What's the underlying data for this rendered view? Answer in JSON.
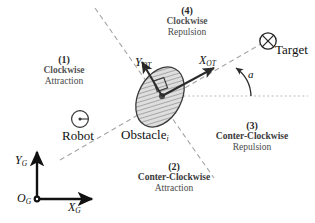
{
  "figure": {
    "type": "schematic-diagram"
  },
  "regions": [
    {
      "number": "(1)",
      "line1": "Clockwise",
      "line2": "Attraction"
    },
    {
      "number": "(2)",
      "line1": "Conter-Clockwise",
      "line2": "Attraction"
    },
    {
      "number": "(3)",
      "line1": "Conter-Clockwise",
      "line2": "Repulsion"
    },
    {
      "number": "(4)",
      "line1": "Clockwise",
      "line2": "Repulsion"
    }
  ],
  "axes": {
    "local_y": {
      "symbol": "Y",
      "subscript": "OT"
    },
    "local_x": {
      "symbol": "X",
      "subscript": "OT"
    },
    "global_y": {
      "symbol": "Y",
      "subscript": "G"
    },
    "global_x": {
      "symbol": "X",
      "subscript": "G"
    },
    "global_origin": {
      "symbol": "O",
      "subscript": "G"
    }
  },
  "entities": {
    "robot": {
      "label": "Robot",
      "icon": "robot-circle-heading-icon"
    },
    "target": {
      "label": "Target",
      "icon": "crossed-circle-icon"
    },
    "obstacle": {
      "label": "Obstacle",
      "subscript": "i",
      "icon": "hatched-ellipse-icon"
    }
  },
  "annotations": {
    "angle": "a"
  },
  "colors": {
    "ink": "#1a1a1a",
    "line": "#333333",
    "dashed": "#9a9a9a",
    "dotted": "#b0b0b0",
    "hatch": "#6e6e6e",
    "obstacle_fill": "#dedede",
    "background": "#ffffff"
  }
}
